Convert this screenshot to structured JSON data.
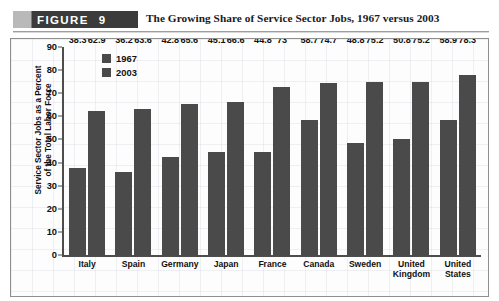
{
  "figure": {
    "banner_label": "FIGURE",
    "banner_number": "9",
    "title": "The Growing Share of Service Sector Jobs, 1967 versus 2003"
  },
  "chart_data": {
    "type": "bar",
    "title": "The Growing Share of Service Sector Jobs, 1967 versus 2003",
    "xlabel": "",
    "ylabel_line1": "Service Sector Jobs as a Percent",
    "ylabel_line2": "of the Total Labor Force",
    "categories": [
      "Italy",
      "Spain",
      "Germany",
      "Japan",
      "France",
      "Canada",
      "Sweden",
      "United Kingdom",
      "United States"
    ],
    "series": [
      {
        "name": "1967",
        "color": "#4a4a4a",
        "values": [
          38.3,
          36.2,
          42.8,
          45.1,
          44.8,
          58.7,
          48.8,
          50.8,
          58.9
        ]
      },
      {
        "name": "2003",
        "color": "#4a4a4a",
        "values": [
          62.9,
          63.6,
          65.6,
          66.6,
          73,
          74.7,
          75.2,
          75.2,
          78.3
        ]
      }
    ],
    "ylim": [
      0,
      90
    ],
    "yticks": [
      90,
      80,
      70,
      60,
      50,
      40,
      30,
      20,
      10,
      0
    ],
    "grid": true,
    "legend_position": "top-left"
  }
}
